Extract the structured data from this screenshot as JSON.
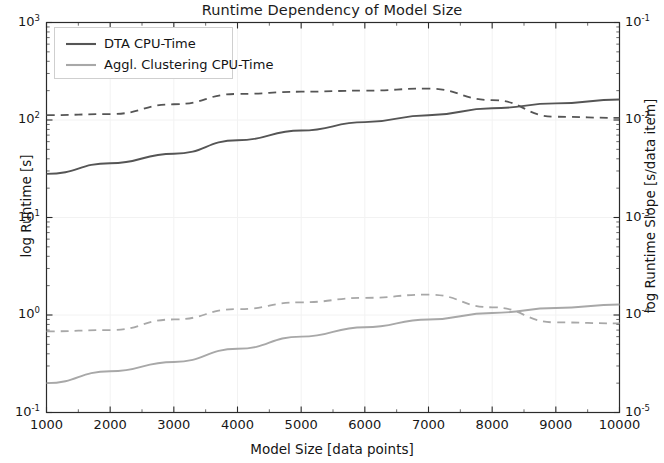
{
  "chart_data": {
    "type": "line",
    "title": "Runtime Dependency of Model Size",
    "xlabel": "Model Size [data points]",
    "ylabel_left": "log Runtime [s]",
    "ylabel_right": "log Runtime Slope [s/data item]",
    "xlim": [
      1000,
      10000
    ],
    "ylim_left": [
      0.1,
      1000
    ],
    "ylim_right": [
      1e-05,
      0.1
    ],
    "xscale": "linear",
    "yscale": "log",
    "grid": true,
    "legend_position": "upper left",
    "xticks": [
      1000,
      2000,
      3000,
      4000,
      5000,
      6000,
      7000,
      8000,
      9000,
      10000
    ],
    "xtick_labels": [
      "1000",
      "2000",
      "3000",
      "4000",
      "5000",
      "6000",
      "7000",
      "8000",
      "9000",
      "10000"
    ],
    "ytick_labels_left": [
      "10³",
      "10²",
      "10¹",
      "10⁰",
      "10⁻¹"
    ],
    "ytick_left_base": [
      "10",
      "10",
      "10",
      "10",
      "10"
    ],
    "ytick_left_exp": [
      "3",
      "2",
      "1",
      "0",
      "-1"
    ],
    "ytick_right_base": [
      "10",
      "10",
      "10",
      "10",
      "10"
    ],
    "ytick_right_exp": [
      "-1",
      "-2",
      "-3",
      "-4",
      "-5"
    ],
    "x": [
      1000,
      2000,
      3000,
      4000,
      5000,
      6000,
      7000,
      8000,
      9000,
      10000
    ],
    "series": [
      {
        "name": "DTA CPU-Time",
        "axis": "left",
        "style": "solid",
        "color": "#555555",
        "values": [
          28,
          36,
          45,
          62,
          78,
          95,
          112,
          132,
          148,
          162
        ]
      },
      {
        "name": "DTA CPU-Time slope",
        "axis": "right",
        "style": "dashed",
        "color": "#555555",
        "values": [
          0.0112,
          0.0115,
          0.0145,
          0.0185,
          0.0195,
          0.02,
          0.021,
          0.016,
          0.0108,
          0.0105
        ]
      },
      {
        "name": "Aggl. Clustering CPU-Time",
        "axis": "left",
        "style": "solid",
        "color": "#a8a8a8",
        "values": [
          0.2,
          0.265,
          0.33,
          0.45,
          0.6,
          0.75,
          0.9,
          1.05,
          1.18,
          1.28
        ]
      },
      {
        "name": "Aggl. Clustering CPU-Time slope",
        "axis": "right",
        "style": "dashed",
        "color": "#a8a8a8",
        "values": [
          6.8e-05,
          7e-05,
          9e-05,
          0.000115,
          0.000135,
          0.00015,
          0.000162,
          0.00012,
          8.4e-05,
          8.2e-05
        ]
      }
    ],
    "legend_entries": [
      {
        "label": "DTA CPU-Time",
        "color": "#555555"
      },
      {
        "label": "Aggl. Clustering CPU-Time",
        "color": "#a8a8a8"
      }
    ]
  },
  "colors": {
    "background": "#ffffff",
    "axis": "#2b2b2b",
    "grid": "#f2f2f2",
    "series_dark": "#555555",
    "series_light": "#a8a8a8",
    "legend_border": "#cfcfcf"
  }
}
